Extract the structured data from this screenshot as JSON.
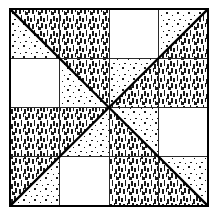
{
  "figure": {
    "title": "Quilt Block Pattern Diagram",
    "type": "line-drawing",
    "canvas": {
      "width": 216,
      "height": 219,
      "background_color": "#ffffff"
    },
    "block": {
      "x": 10,
      "y": 9,
      "width": 198,
      "height": 197,
      "border_color": "#000000",
      "border_width": 2.2
    },
    "center_point": {
      "x": 109,
      "y": 107.5
    },
    "grid": {
      "quadrant_lines": true,
      "sub_grid_lines": true,
      "line_color": "#2a2a2a",
      "line_width": 1.0,
      "diagonal_width": 2.4
    },
    "fills": {
      "plain": "#ffffff",
      "dotted": "#ffffff",
      "dashed": "#ffffff",
      "ink": "#1a1a1a"
    },
    "textures": [
      {
        "key": "plain",
        "label": "plain white fabric"
      },
      {
        "key": "dotted",
        "label": "dotted fabric"
      },
      {
        "key": "dashed",
        "label": "dashed fabric"
      }
    ],
    "quadrants": [
      {
        "name": "top-left",
        "diagonal": "corner-to-center",
        "patches": [
          {
            "position": "upper-left",
            "texture": "dotted"
          },
          {
            "position": "upper-right",
            "texture": "dashed"
          },
          {
            "position": "lower-left",
            "texture": "plain"
          },
          {
            "position": "lower-right",
            "texture": "split-dotted-dashed"
          }
        ]
      },
      {
        "name": "top-right",
        "diagonal": "center-to-corner",
        "patches": [
          {
            "position": "upper-left",
            "texture": "plain"
          },
          {
            "position": "upper-right",
            "texture": "split-dotted-dashed"
          },
          {
            "position": "lower-left",
            "texture": "split-dotted-dashed"
          },
          {
            "position": "lower-right",
            "texture": "dashed"
          }
        ]
      },
      {
        "name": "bottom-left",
        "diagonal": "corner-to-center",
        "patches": [
          {
            "position": "upper-left",
            "texture": "dashed"
          },
          {
            "position": "upper-right",
            "texture": "split-dashed-dotted"
          },
          {
            "position": "lower-left",
            "texture": "split-dashed-dotted"
          },
          {
            "position": "lower-right",
            "texture": "plain"
          }
        ]
      },
      {
        "name": "bottom-right",
        "diagonal": "center-to-corner",
        "patches": [
          {
            "position": "upper-left",
            "texture": "split-dotted-dashed"
          },
          {
            "position": "upper-right",
            "texture": "plain"
          },
          {
            "position": "lower-left",
            "texture": "dashed"
          },
          {
            "position": "lower-right",
            "texture": "split-dashed-dotted"
          }
        ]
      }
    ]
  }
}
